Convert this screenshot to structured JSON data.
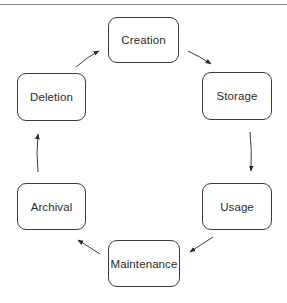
{
  "diagram": {
    "type": "cycle",
    "nodes": [
      {
        "id": "creation",
        "label": "Creation"
      },
      {
        "id": "storage",
        "label": "Storage"
      },
      {
        "id": "usage",
        "label": "Usage"
      },
      {
        "id": "maintenance",
        "label": "Maintenance"
      },
      {
        "id": "archival",
        "label": "Archival"
      },
      {
        "id": "deletion",
        "label": "Deletion"
      }
    ],
    "edges": [
      {
        "from": "creation",
        "to": "storage"
      },
      {
        "from": "storage",
        "to": "usage"
      },
      {
        "from": "usage",
        "to": "maintenance"
      },
      {
        "from": "maintenance",
        "to": "archival"
      },
      {
        "from": "archival",
        "to": "deletion"
      },
      {
        "from": "deletion",
        "to": "creation"
      }
    ],
    "colors": {
      "stroke": "#3a3a3a",
      "text": "#2a2a2a",
      "background": "#ffffff"
    }
  }
}
